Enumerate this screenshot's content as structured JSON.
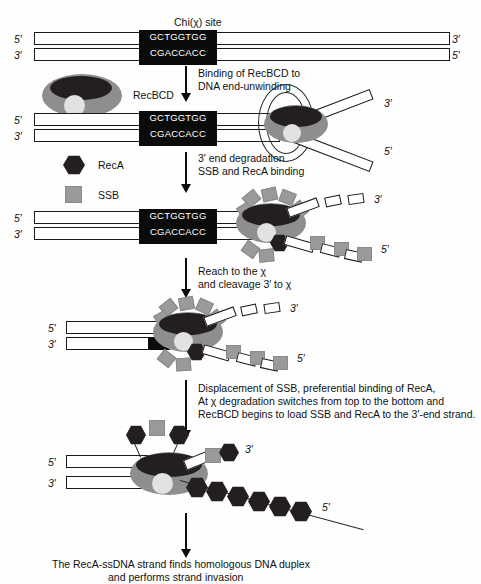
{
  "figure": {
    "title_label": "Chi(χ) site",
    "chi_top_sequence": "GCTGGTGG",
    "chi_bottom_sequence": "CGACCACC",
    "end_5": "5′",
    "end_3": "3′"
  },
  "legend": {
    "reca_label": "RecA",
    "ssb_label": "SSB",
    "recbcd_label": "RecBCD"
  },
  "steps": [
    {
      "id": "step-1",
      "line1": "Binding of RecBCD to",
      "line2": "DNA end-unwinding"
    },
    {
      "id": "step-2",
      "line1": "3′ end degradation",
      "line2": "SSB and RecA binding"
    },
    {
      "id": "step-3",
      "line1": "Reach to the χ",
      "line2": "and cleavage 3′ to χ"
    },
    {
      "id": "step-4",
      "line1": "Displacement of SSB, preferential binding of RecA,",
      "line2": "At χ degradation switches from top to the bottom and",
      "line3": "RecBCD begins to load SSB and RecA to the 3′-end strand."
    }
  ],
  "conclusion": {
    "line1": "The RecA-ssDNA strand finds homologous DNA duplex",
    "line2": "and performs strand invasion"
  },
  "colors": {
    "recbcd_body": "#8e8e8e",
    "recbcd_dark": "#231f20",
    "recbcd_light": "#e2e2e2",
    "ssb": "#9a9a9a",
    "reca": "#231f20",
    "chi_box": "#0b0b0b",
    "stroke": "#1a1a1a",
    "background": "#ffffff"
  },
  "panels": [
    {
      "id": "panel-1",
      "name": "duplex-with-chi-site"
    },
    {
      "id": "panel-2",
      "name": "recbcd-bound-unwinding"
    },
    {
      "id": "panel-3",
      "name": "degradation-ssb-reca-binding"
    },
    {
      "id": "panel-4",
      "name": "chi-cleavage"
    },
    {
      "id": "panel-5",
      "name": "reca-filament-loaded"
    }
  ]
}
